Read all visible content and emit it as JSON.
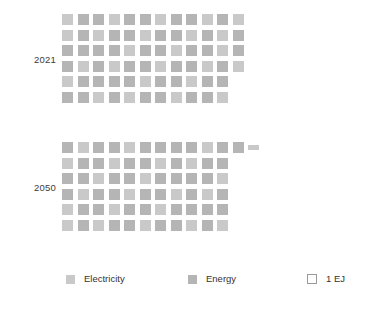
{
  "chart_data": {
    "type": "pictogram",
    "title": "",
    "subtitle": "",
    "xlabel": "",
    "ylabel": "",
    "unit_label": "1 EJ",
    "unit_value": 1,
    "grid": {
      "columns": 12,
      "rows": 6,
      "cell_px": 11,
      "pitch_px": 15.5
    },
    "legend_position": "bottom",
    "series": [
      {
        "name": "Electricity",
        "color": "#c9c9c9"
      },
      {
        "name": "Energy",
        "color": "#b5b5b5"
      }
    ],
    "categories": [
      "2021",
      "2050"
    ],
    "values": [
      70,
      67.5
    ],
    "groups": [
      {
        "label": "2021",
        "total_units": 70,
        "rows": [
          {
            "full": 12,
            "partial": 0
          },
          {
            "full": 12,
            "partial": 0
          },
          {
            "full": 12,
            "partial": 0
          },
          {
            "full": 12,
            "partial": 0
          },
          {
            "full": 11,
            "partial": 0
          },
          {
            "full": 11,
            "partial": 0
          }
        ]
      },
      {
        "label": "2050",
        "total_units": 67.5,
        "rows": [
          {
            "full": 12,
            "partial": 0.5
          },
          {
            "full": 11,
            "partial": 0
          },
          {
            "full": 11,
            "partial": 0
          },
          {
            "full": 11,
            "partial": 0
          },
          {
            "full": 11,
            "partial": 0
          },
          {
            "full": 11,
            "partial": 0
          }
        ]
      }
    ]
  },
  "rows": [
    {
      "label": "2021",
      "top": 14
    },
    {
      "label": "2050",
      "top": 142
    }
  ],
  "legend": {
    "items": [
      {
        "label": "Electricity",
        "swatch": "electricity-swatch",
        "style": "filled",
        "color": "#c9c9c9",
        "left": 66
      },
      {
        "label": "Energy",
        "swatch": "energy-swatch",
        "style": "filled",
        "color": "#b5b5b5",
        "left": 188
      },
      {
        "label": "1 EJ",
        "swatch": "unit-swatch",
        "style": "outline",
        "color": "#ffffff",
        "left": 307
      }
    ]
  },
  "colors": {
    "electricity": "#c9c9c9",
    "energy": "#b5b5b5",
    "outline": "#9a9a9a",
    "text": "#333333",
    "background": "#ffffff"
  }
}
